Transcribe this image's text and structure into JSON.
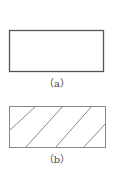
{
  "figures": [
    {
      "id": "a",
      "caption": "（a）",
      "style": "plain-rectangle",
      "stroke_color": "#555555",
      "fill": "none"
    },
    {
      "id": "b",
      "caption": "（b）",
      "style": "hatched-rectangle",
      "stroke_color": "#888888",
      "hatch_color": "#888888",
      "hatch_lines": 4
    }
  ]
}
